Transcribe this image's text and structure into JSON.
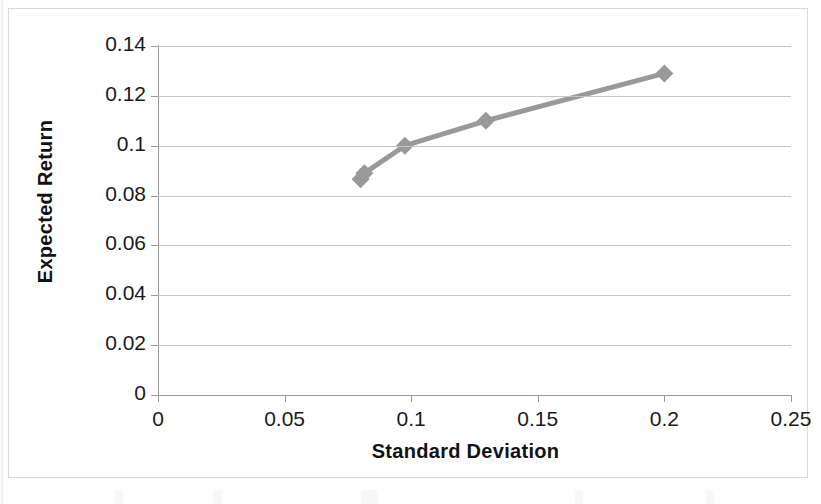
{
  "chart_data": {
    "type": "line",
    "title": "",
    "subtitle": "",
    "xlabel": "Standard Deviation",
    "ylabel": "Expected Return",
    "xlim": [
      0,
      0.25
    ],
    "ylim": [
      0,
      0.14
    ],
    "grid": "horizontal",
    "legend": "none",
    "marker": "diamond",
    "series_color": "#999999",
    "xticks": [
      "0",
      "0.05",
      "0.1",
      "0.15",
      "0.2",
      "0.25"
    ],
    "xtick_values": [
      0,
      0.05,
      0.1,
      0.15,
      0.2,
      0.25
    ],
    "yticks": [
      "0",
      "0.02",
      "0.04",
      "0.06",
      "0.08",
      "0.1",
      "0.12",
      "0.14"
    ],
    "ytick_values": [
      0,
      0.02,
      0.04,
      0.06,
      0.08,
      0.1,
      0.12,
      0.14
    ],
    "series": [
      {
        "name": "Efficient Frontier",
        "x": [
          0.08,
          0.0815,
          0.0975,
          0.1295,
          0.2
        ],
        "y": [
          0.0865,
          0.089,
          0.1,
          0.11,
          0.129
        ]
      }
    ]
  },
  "chart": {
    "x_axis_title": "Standard Deviation",
    "y_axis_title": "Expected Return",
    "y_tick_labels": [
      "0.14",
      "0.12",
      "0.1",
      "0.08",
      "0.06",
      "0.04",
      "0.02",
      "0"
    ],
    "x_tick_labels": [
      "0",
      "0.05",
      "0.1",
      "0.15",
      "0.2",
      "0.25"
    ]
  }
}
